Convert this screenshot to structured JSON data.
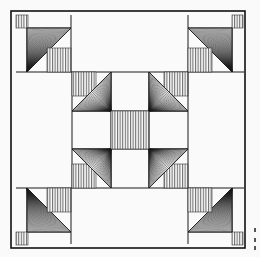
{
  "figure": {
    "type": "quilt-block-line-drawing",
    "colors": {
      "background": "#fafafa",
      "ink": "#1a1a1a"
    },
    "frame": {
      "x": 11,
      "y": 11,
      "w": 234,
      "h": 237
    },
    "margin_marks": [
      {
        "x": 254,
        "y": 228
      },
      {
        "x": 254,
        "y": 238
      },
      {
        "x": 254,
        "y": 246
      }
    ]
  }
}
